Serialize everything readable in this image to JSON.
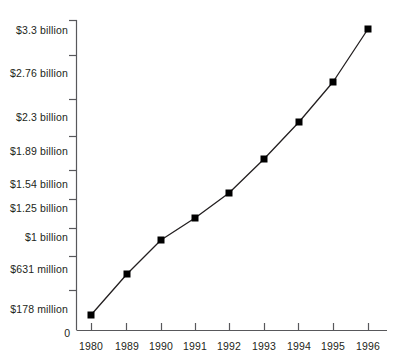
{
  "chart_data": {
    "type": "line",
    "title": "",
    "subtitle": "",
    "xlabel": "",
    "ylabel": "",
    "grid": false,
    "legend": null,
    "categories": [
      "1980",
      "1989",
      "1990",
      "1991",
      "1992",
      "1993",
      "1994",
      "1995",
      "1996"
    ],
    "x_tick_labels": [
      "1980",
      "1989",
      "1990",
      "1991",
      "1992",
      "1993",
      "1994",
      "1995",
      "1996"
    ],
    "y_tick_labels": [
      "$3.3 billion",
      "$2.76 billion",
      "$2.3 billion",
      "$1.89 billion",
      "$1.54 billion",
      "$1.25 billion",
      "$1 billion",
      "$631 million",
      "$178 million",
      "0"
    ],
    "y_axis_origin_label": "0",
    "ylim": [
      0,
      3300
    ],
    "y_unit": "million USD",
    "values": [
      178,
      631,
      1000,
      1250,
      1540,
      1890,
      2300,
      2760,
      3300
    ],
    "value_labels": [
      "$178 million",
      "$631 million",
      "$1 billion",
      "$1.25 billion",
      "$1.54 billion",
      "$1.89 billion",
      "$2.3 billion",
      "$2.76 billion",
      "$3.3 billion"
    ],
    "series": [
      {
        "name": "",
        "values": [
          178,
          631,
          1000,
          1250,
          1540,
          1890,
          2300,
          2760,
          3300
        ],
        "marker": "filled-square",
        "marker_color": "#000000",
        "line_color": "#231f20"
      }
    ],
    "colors": {
      "line": "#231f20",
      "marker": "#000000",
      "axis": "#58585b",
      "text": "#231f20",
      "background": "#ffffff"
    }
  },
  "y_axis": {
    "ticks": [
      {
        "label": "$3.3 billion",
        "y": 31,
        "tick_y": 20
      },
      {
        "label": "$2.76 billion",
        "y": 74,
        "tick_y": 55
      },
      {
        "label": "$2.3 billion",
        "y": 118,
        "tick_y": 99
      },
      {
        "label": "$1.89 billion",
        "y": 152,
        "tick_y": 136
      },
      {
        "label": "$1.54 billion",
        "y": 185,
        "tick_y": 170
      },
      {
        "label": "$1.25 billion",
        "y": 209,
        "tick_y": 199
      },
      {
        "label": "$1 billion",
        "y": 238,
        "tick_y": 228
      },
      {
        "label": "$631 million",
        "y": 270,
        "tick_y": 256
      },
      {
        "label": "$178 million",
        "y": 310,
        "tick_y": 290
      }
    ],
    "origin": {
      "label": "0",
      "y": 328
    }
  },
  "x_axis": {
    "ticks": [
      {
        "label": "1980",
        "x": 91
      },
      {
        "label": "1989",
        "x": 127
      },
      {
        "label": "1990",
        "x": 161
      },
      {
        "label": "1991",
        "x": 195
      },
      {
        "label": "1992",
        "x": 229
      },
      {
        "label": "1993",
        "x": 264
      },
      {
        "label": "1994",
        "x": 299
      },
      {
        "label": "1995",
        "x": 333
      },
      {
        "label": "1996",
        "x": 368
      }
    ],
    "label_y": 341
  },
  "points": [
    {
      "year": "1980",
      "x": 91,
      "y": 315
    },
    {
      "year": "1989",
      "x": 127,
      "y": 274
    },
    {
      "year": "1990",
      "x": 161,
      "y": 240
    },
    {
      "year": "1991",
      "x": 195,
      "y": 218
    },
    {
      "year": "1992",
      "x": 229,
      "y": 193
    },
    {
      "year": "1993",
      "x": 264,
      "y": 159
    },
    {
      "year": "1994",
      "x": 299,
      "y": 122
    },
    {
      "year": "1995",
      "x": 333,
      "y": 82
    },
    {
      "year": "1996",
      "x": 368,
      "y": 29
    }
  ]
}
